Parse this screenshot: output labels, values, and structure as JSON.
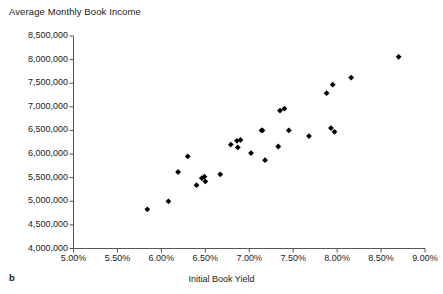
{
  "chart_data": {
    "type": "scatter",
    "title": "Average Monthly Book Income",
    "xlabel": "Initial Book Yield",
    "ylabel": "Average Monthly Book Income",
    "panel_label": "b",
    "grid": false,
    "legend": "none",
    "marker": "diamond",
    "marker_color": "#000000",
    "xlim": [
      5.0,
      9.0
    ],
    "ylim": [
      4000000,
      8500000
    ],
    "xticks": [
      5.0,
      5.5,
      6.0,
      6.5,
      7.0,
      7.5,
      8.0,
      8.5,
      9.0
    ],
    "xtick_labels": [
      "5.00%",
      "5.50%",
      "6.00%",
      "6.50%",
      "7.00%",
      "7.50%",
      "8.00%",
      "8.50%",
      "9.00%"
    ],
    "yticks": [
      4000000,
      4500000,
      5000000,
      5500000,
      6000000,
      6500000,
      7000000,
      7500000,
      8000000,
      8500000
    ],
    "ytick_labels": [
      "4,000,000",
      "4,500,000",
      "5,000,000",
      "5,500,000",
      "6,000,000",
      "6,500,000",
      "7,000,000",
      "7,500,000",
      "8,000,000",
      "8,500,000"
    ],
    "x": [
      5.84,
      6.08,
      6.19,
      6.3,
      6.4,
      6.46,
      6.49,
      6.5,
      6.67,
      6.79,
      6.86,
      6.87,
      6.9,
      7.02,
      7.14,
      7.15,
      7.18,
      7.33,
      7.35,
      7.4,
      7.45,
      7.68,
      7.88,
      7.93,
      7.95,
      7.97,
      8.16,
      8.7
    ],
    "y": [
      4830000,
      5000000,
      5620000,
      5950000,
      5340000,
      5490000,
      5520000,
      5420000,
      5570000,
      6200000,
      6280000,
      6140000,
      6300000,
      6020000,
      6500000,
      6500000,
      5870000,
      6160000,
      6920000,
      6960000,
      6500000,
      6380000,
      7290000,
      6550000,
      7470000,
      6470000,
      7620000,
      8060000
    ]
  }
}
